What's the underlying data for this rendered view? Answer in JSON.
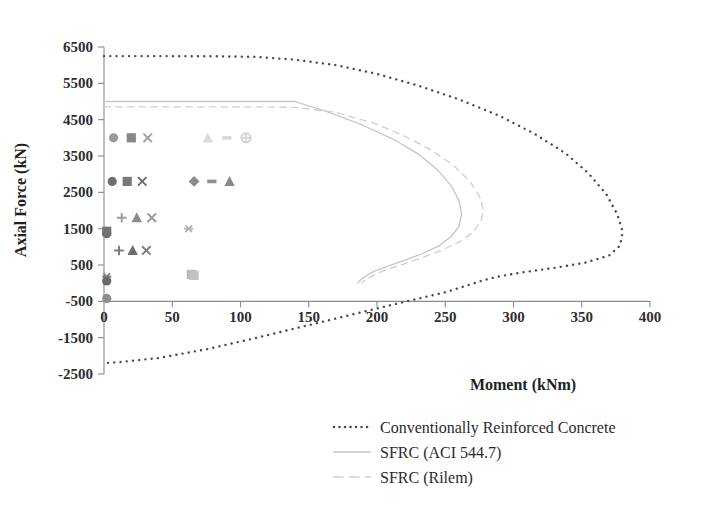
{
  "chart_data": {
    "type": "scatter",
    "title": "",
    "xlabel": "Moment (kNm)",
    "ylabel": "Axial Force (kN)",
    "xlim": [
      0,
      400
    ],
    "ylim": [
      -2500,
      6500
    ],
    "xticks": [
      0,
      50,
      100,
      150,
      200,
      250,
      300,
      350,
      400
    ],
    "xtick_labels": [
      "0",
      "50",
      "100",
      "150",
      "200",
      "250",
      "300",
      "350",
      "400"
    ],
    "yticks": [
      -2500,
      -1500,
      -500,
      500,
      1500,
      2500,
      3500,
      4500,
      5500,
      6500
    ],
    "ytick_labels": [
      "-2500",
      "-1500",
      "-500",
      "500",
      "1500",
      "2500",
      "3500",
      "4500",
      "5500",
      "6500"
    ],
    "grid": false,
    "legend_position": "bottom-center",
    "series": [
      {
        "name": "Conventionally Reinforced Concrete",
        "style": "dotted",
        "color": "#4a4a4a",
        "points": [
          [
            0,
            6250
          ],
          [
            40,
            6250
          ],
          [
            80,
            6245
          ],
          [
            110,
            6230
          ],
          [
            140,
            6150
          ],
          [
            170,
            6000
          ],
          [
            200,
            5760
          ],
          [
            230,
            5440
          ],
          [
            260,
            5060
          ],
          [
            290,
            4600
          ],
          [
            315,
            4120
          ],
          [
            338,
            3580
          ],
          [
            355,
            3020
          ],
          [
            368,
            2450
          ],
          [
            376,
            1900
          ],
          [
            380,
            1420
          ],
          [
            378,
            1030
          ],
          [
            370,
            760
          ],
          [
            352,
            560
          ],
          [
            330,
            420
          ],
          [
            305,
            290
          ],
          [
            288,
            175
          ],
          [
            278,
            80
          ],
          [
            272,
            10
          ],
          [
            268,
            -40
          ],
          [
            250,
            -250
          ],
          [
            215,
            -560
          ],
          [
            180,
            -880
          ],
          [
            145,
            -1200
          ],
          [
            110,
            -1520
          ],
          [
            75,
            -1820
          ],
          [
            40,
            -2060
          ],
          [
            10,
            -2180
          ],
          [
            0,
            -2200
          ]
        ]
      },
      {
        "name": "SFRC (ACI 544.7)",
        "style": "solid",
        "color": "#c6c6c6",
        "points": [
          [
            0,
            5000
          ],
          [
            40,
            5000
          ],
          [
            80,
            5000
          ],
          [
            110,
            5000
          ],
          [
            140,
            5000
          ],
          [
            165,
            4700
          ],
          [
            190,
            4340
          ],
          [
            212,
            3960
          ],
          [
            230,
            3560
          ],
          [
            244,
            3130
          ],
          [
            254,
            2700
          ],
          [
            260,
            2280
          ],
          [
            262,
            1900
          ],
          [
            260,
            1560
          ],
          [
            254,
            1270
          ],
          [
            245,
            1020
          ],
          [
            233,
            810
          ],
          [
            220,
            630
          ],
          [
            208,
            470
          ],
          [
            198,
            330
          ],
          [
            192,
            200
          ],
          [
            188,
            90
          ],
          [
            186,
            10
          ]
        ]
      },
      {
        "name": "SFRC (Rilem)",
        "style": "dashed",
        "color": "#cfcfcf",
        "points": [
          [
            0,
            4850
          ],
          [
            40,
            4850
          ],
          [
            80,
            4850
          ],
          [
            110,
            4850
          ],
          [
            140,
            4840
          ],
          [
            170,
            4700
          ],
          [
            198,
            4400
          ],
          [
            220,
            4050
          ],
          [
            240,
            3660
          ],
          [
            256,
            3240
          ],
          [
            268,
            2810
          ],
          [
            275,
            2400
          ],
          [
            278,
            2020
          ],
          [
            276,
            1680
          ],
          [
            270,
            1390
          ],
          [
            260,
            1130
          ],
          [
            247,
            900
          ],
          [
            233,
            700
          ],
          [
            219,
            520
          ],
          [
            207,
            370
          ],
          [
            198,
            230
          ],
          [
            192,
            110
          ],
          [
            189,
            20
          ]
        ]
      }
    ],
    "scatter_groups": [
      {
        "name": "row-4000-left",
        "points": [
          {
            "x": 7,
            "y": 4000,
            "marker": "circle",
            "color": "#9a9a9a"
          },
          {
            "x": 20,
            "y": 4000,
            "marker": "square",
            "color": "#888888"
          },
          {
            "x": 32,
            "y": 4000,
            "marker": "x",
            "color": "#9e9e9e"
          }
        ]
      },
      {
        "name": "row-4000-right",
        "points": [
          {
            "x": 76,
            "y": 4000,
            "marker": "triangle",
            "color": "#dcdcdc"
          },
          {
            "x": 90,
            "y": 4000,
            "marker": "dash",
            "color": "#d8d8d8"
          },
          {
            "x": 104,
            "y": 4000,
            "marker": "circle-cross",
            "color": "#d2d2d2"
          }
        ]
      },
      {
        "name": "row-2800-left",
        "points": [
          {
            "x": 6,
            "y": 2800,
            "marker": "circle",
            "color": "#6f6f6f"
          },
          {
            "x": 17,
            "y": 2800,
            "marker": "square",
            "color": "#7a7a7a"
          },
          {
            "x": 28,
            "y": 2800,
            "marker": "x",
            "color": "#6a6a6a"
          }
        ]
      },
      {
        "name": "row-2800-right",
        "points": [
          {
            "x": 66,
            "y": 2800,
            "marker": "diamond",
            "color": "#8b8b8b"
          },
          {
            "x": 79,
            "y": 2800,
            "marker": "dash",
            "color": "#8f8f8f"
          },
          {
            "x": 92,
            "y": 2800,
            "marker": "triangle",
            "color": "#8a8a8a"
          }
        ]
      },
      {
        "name": "row-1800",
        "points": [
          {
            "x": 13,
            "y": 1800,
            "marker": "plus",
            "color": "#9a9a9a"
          },
          {
            "x": 24,
            "y": 1800,
            "marker": "triangle",
            "color": "#8a8a8a"
          },
          {
            "x": 35,
            "y": 1800,
            "marker": "x",
            "color": "#9a9a9a"
          },
          {
            "x": 62,
            "y": 1500,
            "marker": "asterisk",
            "color": "#b4b4b4"
          }
        ]
      },
      {
        "name": "row-900",
        "points": [
          {
            "x": 11,
            "y": 900,
            "marker": "plus",
            "color": "#7c7c7c"
          },
          {
            "x": 21,
            "y": 900,
            "marker": "triangle",
            "color": "#6e6e6e"
          },
          {
            "x": 31,
            "y": 900,
            "marker": "x",
            "color": "#7c7c7c"
          }
        ]
      },
      {
        "name": "axis-cluster",
        "points": [
          {
            "x": 2,
            "y": 1430,
            "marker": "square",
            "color": "#787878"
          },
          {
            "x": 2,
            "y": 1360,
            "marker": "circle",
            "color": "#707070"
          },
          {
            "x": 2,
            "y": 180,
            "marker": "asterisk",
            "color": "#7d7d7d"
          },
          {
            "x": 2,
            "y": 60,
            "marker": "circle",
            "color": "#6a6a6a"
          },
          {
            "x": 2,
            "y": -420,
            "marker": "circle",
            "color": "#8e8e8e"
          },
          {
            "x": 64,
            "y": 240,
            "marker": "square",
            "color": "#b9b9b9"
          },
          {
            "x": 66,
            "y": 215,
            "marker": "square",
            "color": "#c2c2c2"
          }
        ]
      }
    ]
  },
  "axes": {
    "x_title": "Moment (kNm)",
    "y_title": "Axial Force (kN)"
  },
  "legend": {
    "items": [
      {
        "label": "Conventionally Reinforced Concrete",
        "style": "dotted",
        "color": "#4a4a4a"
      },
      {
        "label": "SFRC (ACI 544.7)",
        "style": "solid",
        "color": "#c6c6c6"
      },
      {
        "label": "SFRC (Rilem)",
        "style": "dashed",
        "color": "#cfcfcf"
      }
    ]
  }
}
